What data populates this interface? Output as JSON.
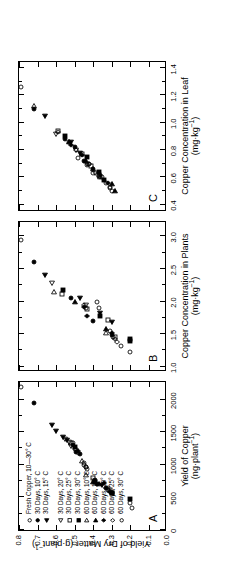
{
  "figure": {
    "background": "#ffffff",
    "ink": "#000000"
  },
  "yaxis": {
    "label_line1": "Yield of Dry Matter (g·plant",
    "label_sup": "−1",
    "label_line2": ")",
    "label_full": "Yield of Dry Matter (g·plant−1)",
    "ticks": [
      "0.0",
      "0.1",
      "0.2",
      "0.3",
      "0.4",
      "0.5",
      "0.6",
      "0.7",
      "0.8"
    ],
    "min": 0.0,
    "max": 0.8
  },
  "panels": [
    {
      "letter": "A",
      "xlabel_line1": "Yield of Copper",
      "xlabel_line2": "(ng·plant",
      "xlabel_sup": "−1",
      "xlabel_line2_end": ")",
      "xlabel_full": "Yield of Copper (ng·plant−1)",
      "xticks": [
        "0",
        "500",
        "1000",
        "1500",
        "2000"
      ],
      "xmin": 0,
      "xmax": 2300,
      "xtick_values": [
        0,
        500,
        1000,
        1500,
        2000
      ]
    },
    {
      "letter": "B",
      "xlabel_line1": "Copper Concentration in Plants",
      "xlabel_line2": "(mg·kg",
      "xlabel_sup": "−1",
      "xlabel_line2_end": ")",
      "xlabel_full": "Copper Concentration in Plants (mg·kg−1)",
      "xticks": [
        "1.0",
        "1.5",
        "2.0",
        "2.5",
        "3.0"
      ],
      "xmin": 0.95,
      "xmax": 3.25,
      "xtick_values": [
        1.0,
        1.5,
        2.0,
        2.5,
        3.0
      ]
    },
    {
      "letter": "C",
      "xlabel_line1": "Copper Concentration in Leaf",
      "xlabel_line2": "(mg·kg",
      "xlabel_sup": "−1",
      "xlabel_line2_end": ")",
      "xlabel_full": "Copper Concentration in Leaf (mg·kg−1)",
      "xticks": [
        "0.4",
        "0.6",
        "0.8",
        "1.0",
        "1.2",
        "1.4"
      ],
      "xmin": 0.36,
      "xmax": 1.46,
      "xtick_values": [
        0.4,
        0.6,
        0.8,
        1.0,
        1.2,
        1.4
      ]
    }
  ],
  "legend": {
    "entries": [
      {
        "symbol": "open-circle",
        "label": "Fresh Copper, 10—30° C"
      },
      {
        "symbol": "filled-circle",
        "label": "30 Days, 10° C"
      },
      {
        "symbol": "filled-left-triangle",
        "label": "30 Days, 15° C"
      },
      {
        "symbol": "open-left-triangle",
        "label": "30 Days, 20° C"
      },
      {
        "symbol": "open-square",
        "label": "30 Days, 25° C"
      },
      {
        "symbol": "filled-square",
        "label": "30 Days, 30° C"
      },
      {
        "symbol": "open-right-triangle",
        "label": "60 Days, 10° C"
      },
      {
        "symbol": "filled-right-triangle",
        "label": "60 Days, 15° C"
      },
      {
        "symbol": "filled-diamond",
        "label": "60 Days, 20° C"
      },
      {
        "symbol": "open-diamond",
        "label": "60 Days, 25° C"
      },
      {
        "symbol": "open-circle",
        "label": "60 Days, 30° C"
      }
    ]
  },
  "chart_data": {
    "type": "scatter",
    "title": "",
    "ylabel": "Yield of Dry Matter (g·plant−1)",
    "ylim": [
      0.0,
      0.8
    ],
    "grid": false,
    "legend_position": "inside-panel-A",
    "panels": [
      {
        "letter": "A",
        "xlabel": "Yield of Copper (ng·plant−1)",
        "xlim": [
          0,
          2300
        ],
        "series": [
          {
            "name": "Fresh Copper, 10—30° C",
            "symbol": "open-circle",
            "points": [
              [
                2190,
                0.79
              ],
              [
                1020,
                0.45
              ],
              [
                960,
                0.44
              ],
              [
                930,
                0.43
              ],
              [
                1330,
                0.51
              ],
              [
                640,
                0.33
              ],
              [
                620,
                0.32
              ],
              [
                410,
                0.2
              ],
              [
                1240,
                0.5
              ]
            ]
          },
          {
            "name": "30 Days, 10° C",
            "symbol": "filled-circle",
            "points": [
              [
                1950,
                0.72
              ],
              [
                1190,
                0.49
              ],
              [
                1160,
                0.47
              ],
              [
                700,
                0.38
              ],
              [
                760,
                0.39
              ],
              [
                1310,
                0.51
              ]
            ]
          },
          {
            "name": "30 Days, 15° C",
            "symbol": "filled-left-triangle",
            "points": [
              [
                1610,
                0.62
              ],
              [
                1520,
                0.6
              ],
              [
                1430,
                0.56
              ],
              [
                1380,
                0.54
              ],
              [
                690,
                0.35
              ]
            ]
          },
          {
            "name": "30 Days, 20° C",
            "symbol": "open-left-triangle",
            "points": [
              [
                1400,
                0.55
              ],
              [
                1350,
                0.53
              ],
              [
                1290,
                0.52
              ]
            ]
          },
          {
            "name": "30 Days, 25° C",
            "symbol": "open-square",
            "points": [
              [
                1330,
                0.52
              ],
              [
                800,
                0.4
              ],
              [
                620,
                0.31
              ],
              [
                560,
                0.3
              ]
            ]
          },
          {
            "name": "30 Days, 30° C",
            "symbol": "filled-square",
            "points": [
              [
                1280,
                0.5
              ],
              [
                730,
                0.39
              ],
              [
                560,
                0.3
              ],
              [
                480,
                0.2
              ]
            ]
          },
          {
            "name": "60 Days, 10° C",
            "symbol": "open-right-triangle",
            "points": [
              [
                840,
                0.44
              ],
              [
                1060,
                0.46
              ]
            ]
          },
          {
            "name": "60 Days, 15° C",
            "symbol": "filled-right-triangle",
            "points": [
              [
                740,
                0.4
              ],
              [
                700,
                0.37
              ]
            ]
          },
          {
            "name": "60 Days, 20° C",
            "symbol": "filled-diamond",
            "points": [
              [
                720,
                0.34
              ],
              [
                640,
                0.33
              ],
              [
                1210,
                0.48
              ],
              [
                580,
                0.31
              ]
            ]
          },
          {
            "name": "60 Days, 25° C",
            "symbol": "open-diamond",
            "points": [
              [
                1240,
                0.49
              ],
              [
                1180,
                0.48
              ],
              [
                600,
                0.31
              ],
              [
                560,
                0.3
              ]
            ]
          },
          {
            "name": "60 Days, 30° C",
            "symbol": "open-circle",
            "points": [
              [
                1000,
                0.45
              ],
              [
                970,
                0.44
              ],
              [
                640,
                0.32
              ],
              [
                330,
                0.19
              ]
            ]
          }
        ]
      },
      {
        "letter": "B",
        "xlabel": "Copper Concentration in Plants (mg·kg−1)",
        "xlim": [
          0.95,
          3.25
        ],
        "series": [
          {
            "name": "Fresh Copper, 10—30° C",
            "symbol": "open-circle",
            "points": [
              [
                2.95,
                0.79
              ],
              [
                1.22,
                0.2
              ],
              [
                1.55,
                0.31
              ],
              [
                1.9,
                0.37
              ],
              [
                2.0,
                0.38
              ]
            ]
          },
          {
            "name": "30 Days, 10° C",
            "symbol": "filled-circle",
            "points": [
              [
                2.6,
                0.72
              ],
              [
                2.05,
                0.52
              ],
              [
                1.7,
                0.4
              ],
              [
                1.48,
                0.3
              ]
            ]
          },
          {
            "name": "30 Days, 15° C",
            "symbol": "filled-left-triangle",
            "points": [
              [
                2.4,
                0.66
              ],
              [
                2.05,
                0.47
              ],
              [
                1.82,
                0.36
              ],
              [
                1.68,
                0.3
              ]
            ]
          },
          {
            "name": "30 Days, 20° C",
            "symbol": "open-left-triangle",
            "points": [
              [
                2.28,
                0.62
              ],
              [
                1.95,
                0.44
              ]
            ]
          },
          {
            "name": "30 Days, 25° C",
            "symbol": "open-square",
            "points": [
              [
                2.12,
                0.57
              ],
              [
                1.88,
                0.43
              ],
              [
                1.72,
                0.32
              ],
              [
                1.45,
                0.28
              ]
            ]
          },
          {
            "name": "30 Days, 30° C",
            "symbol": "filled-square",
            "points": [
              [
                2.18,
                0.56
              ],
              [
                1.78,
                0.36
              ],
              [
                1.4,
                0.2
              ],
              [
                1.42,
                0.2
              ]
            ]
          },
          {
            "name": "60 Days, 10° C",
            "symbol": "open-right-triangle",
            "points": [
              [
                2.14,
                0.61
              ],
              [
                1.52,
                0.33
              ]
            ]
          },
          {
            "name": "60 Days, 15° C",
            "symbol": "filled-right-triangle",
            "points": [
              [
                2.0,
                0.5
              ],
              [
                1.58,
                0.33
              ]
            ]
          },
          {
            "name": "60 Days, 20° C",
            "symbol": "filled-diamond",
            "points": [
              [
                1.78,
                0.43
              ],
              [
                1.52,
                0.3
              ],
              [
                1.92,
                0.45
              ]
            ]
          },
          {
            "name": "60 Days, 25° C",
            "symbol": "open-diamond",
            "points": [
              [
                1.95,
                0.45
              ],
              [
                1.42,
                0.28
              ],
              [
                1.38,
                0.27
              ]
            ]
          },
          {
            "name": "60 Days, 30° C",
            "symbol": "open-circle",
            "points": [
              [
                1.9,
                0.44
              ],
              [
                1.45,
                0.29
              ],
              [
                1.32,
                0.25
              ]
            ]
          }
        ]
      },
      {
        "letter": "C",
        "xlabel": "Copper Concentration in Leaf (mg·kg−1)",
        "xlim": [
          0.36,
          1.46
        ],
        "series": [
          {
            "name": "Fresh Copper, 10—30° C",
            "symbol": "open-circle",
            "points": [
              [
                1.26,
                0.79
              ],
              [
                0.74,
                0.48
              ],
              [
                0.69,
                0.43
              ],
              [
                0.63,
                0.4
              ],
              [
                0.56,
                0.33
              ],
              [
                0.52,
                0.31
              ],
              [
                0.61,
                0.37
              ]
            ]
          },
          {
            "name": "30 Days, 10° C",
            "symbol": "filled-circle",
            "points": [
              [
                1.1,
                0.72
              ],
              [
                0.88,
                0.55
              ],
              [
                0.82,
                0.5
              ],
              [
                0.72,
                0.45
              ],
              [
                0.66,
                0.4
              ]
            ]
          },
          {
            "name": "30 Days, 15° C",
            "symbol": "filled-left-triangle",
            "points": [
              [
                1.05,
                0.66
              ],
              [
                0.86,
                0.52
              ],
              [
                0.78,
                0.47
              ]
            ]
          },
          {
            "name": "30 Days, 20° C",
            "symbol": "open-left-triangle",
            "points": [
              [
                0.92,
                0.6
              ],
              [
                0.8,
                0.49
              ],
              [
                0.7,
                0.43
              ],
              [
                0.63,
                0.39
              ]
            ]
          },
          {
            "name": "30 Days, 25° C",
            "symbol": "open-square",
            "points": [
              [
                0.94,
                0.59
              ],
              [
                0.77,
                0.46
              ],
              [
                0.68,
                0.41
              ],
              [
                0.62,
                0.37
              ]
            ]
          },
          {
            "name": "30 Days, 30° C",
            "symbol": "filled-square",
            "points": [
              [
                0.9,
                0.55
              ],
              [
                0.75,
                0.43
              ],
              [
                0.64,
                0.37
              ],
              [
                0.58,
                0.34
              ]
            ]
          },
          {
            "name": "60 Days, 10° C",
            "symbol": "open-right-triangle",
            "points": [
              [
                1.12,
                0.72
              ],
              [
                0.66,
                0.4
              ],
              [
                0.6,
                0.36
              ]
            ]
          },
          {
            "name": "60 Days, 15° C",
            "symbol": "filled-right-triangle",
            "points": [
              [
                0.86,
                0.53
              ],
              [
                0.72,
                0.44
              ],
              [
                0.55,
                0.3
              ],
              [
                0.5,
                0.28
              ]
            ]
          },
          {
            "name": "60 Days, 20° C",
            "symbol": "filled-diamond",
            "points": [
              [
                0.84,
                0.52
              ],
              [
                0.76,
                0.46
              ],
              [
                0.62,
                0.36
              ],
              [
                0.56,
                0.32
              ]
            ]
          },
          {
            "name": "60 Days, 25° C",
            "symbol": "open-diamond",
            "points": [
              [
                0.93,
                0.59
              ],
              [
                0.8,
                0.49
              ],
              [
                0.7,
                0.42
              ],
              [
                0.6,
                0.36
              ]
            ]
          },
          {
            "name": "60 Days, 30° C",
            "symbol": "open-circle",
            "points": [
              [
                0.86,
                0.53
              ],
              [
                0.7,
                0.42
              ],
              [
                0.6,
                0.35
              ],
              [
                0.53,
                0.31
              ],
              [
                0.5,
                0.3
              ]
            ]
          }
        ]
      }
    ]
  }
}
